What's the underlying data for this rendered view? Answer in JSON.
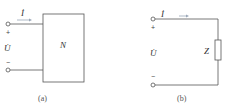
{
  "diagram_a": {
    "current_label": "İ",
    "voltage_label": "U̇",
    "plus": "+",
    "minus": "−",
    "network_label": "N",
    "caption": "(a)"
  },
  "diagram_b": {
    "current_label": "İ",
    "voltage_label": "U̇",
    "plus": "+",
    "minus": "−",
    "impedance_label": "Z",
    "caption": "(b)"
  },
  "colors": {
    "wire": "#555555",
    "arrow": "#9aa7b8"
  }
}
